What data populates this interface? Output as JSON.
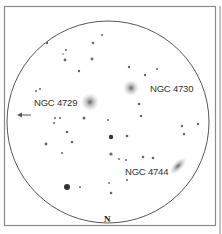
{
  "diagram": {
    "type": "eyepiece-sketch",
    "labels": {
      "ngc4729": "NGC 4729",
      "ngc4730": "NGC 4730",
      "ngc4744": "NGC 4744",
      "north": "N"
    },
    "direction_arrow": "west-arrow",
    "colors": {
      "frame": "#8a8a8a",
      "circle": "#444444",
      "star": "#555555",
      "galaxy": "#777777"
    },
    "field_circle": {
      "cx": 108,
      "cy": 122,
      "r": 101
    },
    "galaxies": [
      {
        "name": "NGC 4729",
        "x": 90,
        "y": 102,
        "rx": 9,
        "ry": 9,
        "rot": 0
      },
      {
        "name": "NGC 4730",
        "x": 131,
        "y": 88,
        "rx": 8,
        "ry": 8,
        "rot": 0
      },
      {
        "name": "NGC 4744",
        "x": 178,
        "y": 166,
        "rx": 11,
        "ry": 5,
        "rot": -45
      }
    ],
    "stars": [
      {
        "x": 47,
        "y": 43,
        "r": 1.2
      },
      {
        "x": 66,
        "y": 50,
        "r": 1.0
      },
      {
        "x": 63,
        "y": 54,
        "r": 0.8
      },
      {
        "x": 65,
        "y": 60,
        "r": 1.4
      },
      {
        "x": 93,
        "y": 43,
        "r": 1.3
      },
      {
        "x": 102,
        "y": 35,
        "r": 1.0
      },
      {
        "x": 92,
        "y": 59,
        "r": 1.4
      },
      {
        "x": 79,
        "y": 71,
        "r": 1.2
      },
      {
        "x": 36,
        "y": 91,
        "r": 1.0
      },
      {
        "x": 40,
        "y": 89,
        "r": 1.0
      },
      {
        "x": 129,
        "y": 67,
        "r": 1.2
      },
      {
        "x": 145,
        "y": 75,
        "r": 1.2
      },
      {
        "x": 157,
        "y": 69,
        "r": 1.0
      },
      {
        "x": 139,
        "y": 104,
        "r": 1.3
      },
      {
        "x": 141,
        "y": 116,
        "r": 1.2
      },
      {
        "x": 84,
        "y": 118,
        "r": 1.5
      },
      {
        "x": 55,
        "y": 118,
        "r": 1.0
      },
      {
        "x": 60,
        "y": 118,
        "r": 1.0
      },
      {
        "x": 54,
        "y": 123,
        "r": 1.0
      },
      {
        "x": 67,
        "y": 132,
        "r": 1.3
      },
      {
        "x": 72,
        "y": 142,
        "r": 1.3
      },
      {
        "x": 46,
        "y": 144,
        "r": 1.4
      },
      {
        "x": 62,
        "y": 153,
        "r": 1.0
      },
      {
        "x": 111,
        "y": 137,
        "r": 2.2
      },
      {
        "x": 127,
        "y": 136,
        "r": 1.3
      },
      {
        "x": 111,
        "y": 154,
        "r": 1.6
      },
      {
        "x": 119,
        "y": 159,
        "r": 0.9
      },
      {
        "x": 143,
        "y": 157,
        "r": 1.3
      },
      {
        "x": 153,
        "y": 158,
        "r": 1.3
      },
      {
        "x": 126,
        "y": 160,
        "r": 1.0
      },
      {
        "x": 182,
        "y": 126,
        "r": 1.2
      },
      {
        "x": 184,
        "y": 134,
        "r": 1.2
      },
      {
        "x": 198,
        "y": 124,
        "r": 1.2
      },
      {
        "x": 127,
        "y": 180,
        "r": 1.0
      },
      {
        "x": 111,
        "y": 193,
        "r": 1.3
      },
      {
        "x": 67,
        "y": 187,
        "r": 3.0
      },
      {
        "x": 80,
        "y": 187,
        "r": 1.0
      },
      {
        "x": 108,
        "y": 120,
        "r": 1.0
      },
      {
        "x": 109,
        "y": 183,
        "r": 0.9
      }
    ]
  }
}
